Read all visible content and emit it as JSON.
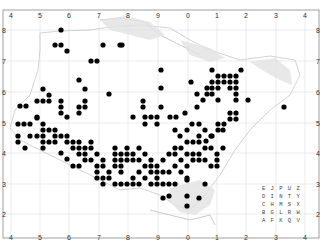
{
  "map": {
    "type": "distribution-dot-map",
    "grid": {
      "x_labels": [
        "4",
        "5",
        "6",
        "7",
        "8",
        "9",
        "0",
        "1",
        "2",
        "3",
        "4"
      ],
      "x_positions": [
        11,
        40,
        69,
        99,
        128,
        158,
        188,
        217,
        246,
        276,
        305
      ],
      "y_labels": [
        "8",
        "7",
        "6",
        "5",
        "4",
        "3",
        "2"
      ],
      "y_positions": [
        30,
        61,
        92,
        123,
        153,
        184,
        214
      ],
      "line_color": "#dddddd",
      "frame": {
        "x": 3,
        "y": 10,
        "w": 316,
        "h": 228
      }
    },
    "dot_color": "#000000",
    "dot_radius": 2.6,
    "coast_color": "#c8c8c8",
    "tetrad_legend": {
      "rows": [
        "E J P U Z",
        "D I N T Y",
        "C H M S X",
        "B G L R W",
        "A F K Q V"
      ],
      "x": 262,
      "y": 190
    },
    "dots": [
      [
        55,
        45
      ],
      [
        61,
        45
      ],
      [
        67,
        51
      ],
      [
        103,
        45
      ],
      [
        120,
        45
      ],
      [
        91,
        61
      ],
      [
        97,
        61
      ],
      [
        79,
        80
      ],
      [
        85,
        89
      ],
      [
        109,
        94
      ],
      [
        43,
        89
      ],
      [
        49,
        95
      ],
      [
        37,
        101
      ],
      [
        43,
        101
      ],
      [
        49,
        101
      ],
      [
        20,
        106
      ],
      [
        26,
        106
      ],
      [
        61,
        101
      ],
      [
        61,
        107
      ],
      [
        61,
        113
      ],
      [
        79,
        107
      ],
      [
        79,
        113
      ],
      [
        85,
        101
      ],
      [
        85,
        107
      ],
      [
        37,
        117
      ],
      [
        67,
        117
      ],
      [
        133,
        117
      ],
      [
        145,
        117
      ],
      [
        151,
        117
      ],
      [
        157,
        117
      ],
      [
        61,
        30
      ],
      [
        122,
        45
      ],
      [
        161,
        70
      ],
      [
        161,
        88
      ],
      [
        191,
        82
      ],
      [
        212,
        70
      ],
      [
        218,
        76
      ],
      [
        224,
        76
      ],
      [
        230,
        76
      ],
      [
        236,
        76
      ],
      [
        212,
        82
      ],
      [
        218,
        82
      ],
      [
        224,
        82
      ],
      [
        230,
        82
      ],
      [
        236,
        82
      ],
      [
        241,
        70
      ],
      [
        207,
        88
      ],
      [
        212,
        88
      ],
      [
        218,
        88
      ],
      [
        230,
        88
      ],
      [
        236,
        88
      ],
      [
        207,
        94
      ],
      [
        212,
        94
      ],
      [
        218,
        100
      ],
      [
        236,
        94
      ],
      [
        236,
        100
      ],
      [
        248,
        100
      ],
      [
        284,
        107
      ],
      [
        143,
        101
      ],
      [
        143,
        107
      ],
      [
        161,
        107
      ],
      [
        197,
        94
      ],
      [
        203,
        100
      ],
      [
        197,
        107
      ],
      [
        185,
        113
      ],
      [
        230,
        113
      ],
      [
        236,
        113
      ],
      [
        236,
        119
      ],
      [
        230,
        119
      ],
      [
        224,
        124
      ],
      [
        218,
        130
      ],
      [
        212,
        136
      ],
      [
        206,
        141
      ],
      [
        170,
        117
      ],
      [
        176,
        117
      ],
      [
        18,
        124
      ],
      [
        24,
        124
      ],
      [
        30,
        124
      ],
      [
        37,
        118
      ],
      [
        43,
        124
      ],
      [
        43,
        130
      ],
      [
        49,
        130
      ],
      [
        55,
        130
      ],
      [
        43,
        136
      ],
      [
        43,
        142
      ],
      [
        37,
        136
      ],
      [
        18,
        136
      ],
      [
        18,
        142
      ],
      [
        25,
        148
      ],
      [
        55,
        136
      ],
      [
        55,
        142
      ],
      [
        61,
        136
      ],
      [
        67,
        136
      ],
      [
        67,
        142
      ],
      [
        73,
        142
      ],
      [
        73,
        148
      ],
      [
        79,
        142
      ],
      [
        79,
        148
      ],
      [
        79,
        154
      ],
      [
        85,
        148
      ],
      [
        85,
        154
      ],
      [
        85,
        160
      ],
      [
        91,
        142
      ],
      [
        91,
        160
      ],
      [
        97,
        166
      ],
      [
        97,
        172
      ],
      [
        103,
        160
      ],
      [
        103,
        166
      ],
      [
        109,
        172
      ],
      [
        109,
        178
      ],
      [
        115,
        148
      ],
      [
        115,
        154
      ],
      [
        115,
        160
      ],
      [
        115,
        166
      ],
      [
        121,
        154
      ],
      [
        121,
        160
      ],
      [
        121,
        166
      ],
      [
        121,
        172
      ],
      [
        115,
        184
      ],
      [
        121,
        184
      ],
      [
        127,
        148
      ],
      [
        127,
        154
      ],
      [
        127,
        160
      ],
      [
        133,
        154
      ],
      [
        133,
        160
      ],
      [
        139,
        148
      ],
      [
        139,
        160
      ],
      [
        139,
        172
      ],
      [
        145,
        154
      ],
      [
        145,
        166
      ],
      [
        151,
        160
      ],
      [
        151,
        166
      ],
      [
        151,
        172
      ],
      [
        157,
        166
      ],
      [
        157,
        172
      ],
      [
        157,
        178
      ],
      [
        163,
        160
      ],
      [
        163,
        172
      ],
      [
        169,
        172
      ],
      [
        175,
        166
      ],
      [
        133,
        178
      ],
      [
        127,
        184
      ],
      [
        133,
        184
      ],
      [
        139,
        184
      ],
      [
        145,
        178
      ],
      [
        151,
        184
      ],
      [
        157,
        184
      ],
      [
        163,
        184
      ],
      [
        169,
        184
      ],
      [
        175,
        184
      ],
      [
        181,
        172
      ],
      [
        187,
        166
      ],
      [
        187,
        178
      ],
      [
        187,
        196
      ],
      [
        169,
        196
      ],
      [
        187,
        142
      ],
      [
        193,
        142
      ],
      [
        199,
        142
      ],
      [
        205,
        148
      ],
      [
        211,
        148
      ],
      [
        175,
        148
      ],
      [
        181,
        148
      ],
      [
        187,
        154
      ],
      [
        193,
        154
      ],
      [
        199,
        154
      ],
      [
        205,
        160
      ],
      [
        181,
        160
      ],
      [
        193,
        160
      ],
      [
        199,
        160
      ],
      [
        217,
        160
      ],
      [
        217,
        166
      ],
      [
        211,
        166
      ],
      [
        175,
        154
      ],
      [
        169,
        154
      ],
      [
        145,
        124
      ],
      [
        157,
        124
      ],
      [
        175,
        130
      ],
      [
        187,
        130
      ],
      [
        205,
        130
      ],
      [
        211,
        136
      ],
      [
        192,
        124
      ],
      [
        199,
        124
      ],
      [
        218,
        124
      ],
      [
        223,
        130
      ],
      [
        199,
        136
      ],
      [
        180,
        136
      ],
      [
        187,
        180
      ],
      [
        205,
        184
      ],
      [
        217,
        154
      ],
      [
        223,
        148
      ],
      [
        187,
        206
      ],
      [
        199,
        198
      ],
      [
        163,
        198
      ],
      [
        67,
        159
      ],
      [
        61,
        153
      ],
      [
        73,
        166
      ],
      [
        79,
        166
      ],
      [
        97,
        178
      ],
      [
        103,
        178
      ],
      [
        103,
        184
      ],
      [
        97,
        154
      ],
      [
        91,
        148
      ],
      [
        49,
        142
      ],
      [
        30,
        136
      ],
      [
        43,
        148
      ]
    ]
  }
}
